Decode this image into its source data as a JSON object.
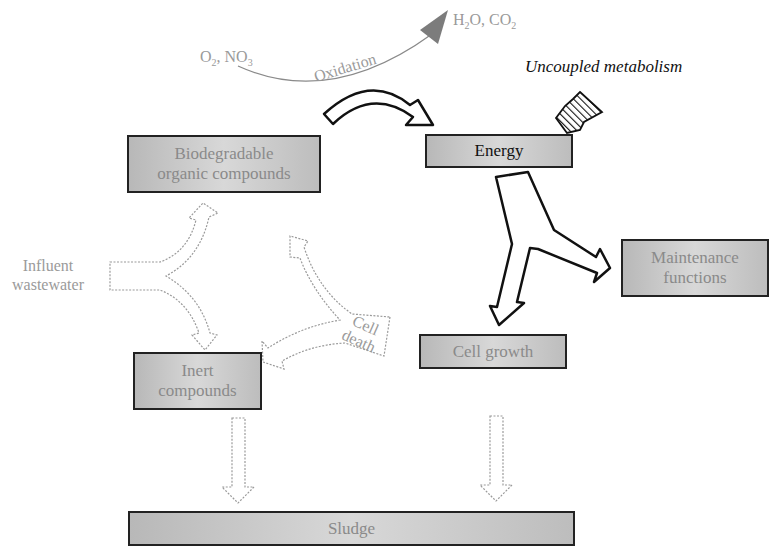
{
  "diagram": {
    "title": "",
    "nodes": {
      "biodegradable": {
        "label_line1": "Biodegradable",
        "label_line2": "organic compounds"
      },
      "energy": {
        "label": "Energy"
      },
      "maintenance": {
        "label_line1": "Maintenance",
        "label_line2": "functions"
      },
      "cell_growth": {
        "label": "Cell growth"
      },
      "inert": {
        "label_line1": "Inert",
        "label_line2": "compounds"
      },
      "sludge": {
        "label": "Sludge"
      }
    },
    "labels": {
      "o2_no3": {
        "o": "O",
        "o_sub": "2",
        "sep": ", NO",
        "no_sub": "3"
      },
      "h2o_co2": {
        "h": "H",
        "h_sub": "2",
        "mid": "O, CO",
        "c_sub": "2"
      },
      "oxidation": "Oxidation",
      "uncoupled": "Uncoupled metabolism",
      "influent_line1": "Influent",
      "influent_line2": "wastewater",
      "cell_death_line1": "Cell",
      "cell_death_line2": "death"
    },
    "edges": [
      {
        "from": "O2, NO3",
        "to": "H2O, CO2",
        "label": "Oxidation",
        "style": "thin-grey-curve"
      },
      {
        "from": "oxidation",
        "to": "Energy",
        "style": "thick-outline-curved"
      },
      {
        "from": "Uncoupled metabolism",
        "to": "Energy",
        "style": "striped"
      },
      {
        "from": "Energy",
        "to": [
          "Cell growth",
          "Maintenance functions"
        ],
        "style": "thick-outline-split"
      },
      {
        "from": "Influent wastewater",
        "to": [
          "Biodegradable organic compounds",
          "Inert compounds"
        ],
        "style": "dotted-split"
      },
      {
        "from": "Cell death",
        "to": [
          "Biodegradable organic compounds",
          "Inert compounds"
        ],
        "style": "dotted-split"
      },
      {
        "from": "Inert compounds",
        "to": "Sludge",
        "style": "dotted-down"
      },
      {
        "from": "Cell growth",
        "to": "Sludge",
        "style": "dotted-down"
      }
    ],
    "colors": {
      "box_fill": "#c8c8c8",
      "box_border": "#222222",
      "grey_text": "#9a9a9a",
      "dark_text": "#111111",
      "oxidation_arrow": "#808080"
    }
  }
}
